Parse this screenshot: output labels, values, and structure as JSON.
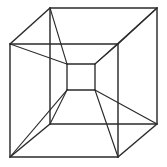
{
  "figure": {
    "name": "tesseract-wireframe",
    "title": "Tesseract wireframe projection",
    "canvas": {
      "width": 167,
      "height": 167
    },
    "background_color": "#ffffff",
    "stroke_color": "#2b2b2b",
    "stroke_width": 1.25
  },
  "geometry": {
    "outer_cube": {
      "label": "outer-cube",
      "front_face": {
        "label": "outer-front-face",
        "points": "10,44 118,44 118,157 10,157"
      },
      "back_face": {
        "label": "outer-back-face",
        "points": "50,8 157,8 157,124 50,124"
      },
      "connectors": [
        {
          "label": "outer-connector-top-left",
          "x1": 10,
          "y1": 44,
          "x2": 50,
          "y2": 8
        },
        {
          "label": "outer-connector-top-right",
          "x1": 118,
          "y1": 44,
          "x2": 157,
          "y2": 8
        },
        {
          "label": "outer-connector-bottom-right",
          "x1": 118,
          "y1": 157,
          "x2": 157,
          "y2": 124
        },
        {
          "label": "outer-connector-bottom-left",
          "x1": 10,
          "y1": 157,
          "x2": 50,
          "y2": 124
        }
      ]
    },
    "inner_cube": {
      "label": "inner-cube",
      "front_face": {
        "label": "inner-front-face",
        "points": "67,64 95,64 95,90 67,90"
      },
      "back_face": {
        "label": "inner-back-face",
        "points": "67,64 95,64 95,90 67,90"
      },
      "connectors": []
    },
    "hyper_edges": [
      {
        "label": "hyper-edge-front-top-left",
        "x1": 10,
        "y1": 44,
        "x2": 67,
        "y2": 64
      },
      {
        "label": "hyper-edge-front-top-right",
        "x1": 118,
        "y1": 44,
        "x2": 95,
        "y2": 64
      },
      {
        "label": "hyper-edge-front-bottom-right",
        "x1": 118,
        "y1": 157,
        "x2": 95,
        "y2": 90
      },
      {
        "label": "hyper-edge-front-bottom-left",
        "x1": 10,
        "y1": 157,
        "x2": 67,
        "y2": 90
      },
      {
        "label": "hyper-edge-back-top-left",
        "x1": 50,
        "y1": 8,
        "x2": 67,
        "y2": 64
      },
      {
        "label": "hyper-edge-back-top-right",
        "x1": 157,
        "y1": 8,
        "x2": 95,
        "y2": 64
      },
      {
        "label": "hyper-edge-back-bottom-right",
        "x1": 157,
        "y1": 124,
        "x2": 95,
        "y2": 90
      },
      {
        "label": "hyper-edge-back-bottom-left",
        "x1": 50,
        "y1": 124,
        "x2": 67,
        "y2": 90
      }
    ]
  }
}
